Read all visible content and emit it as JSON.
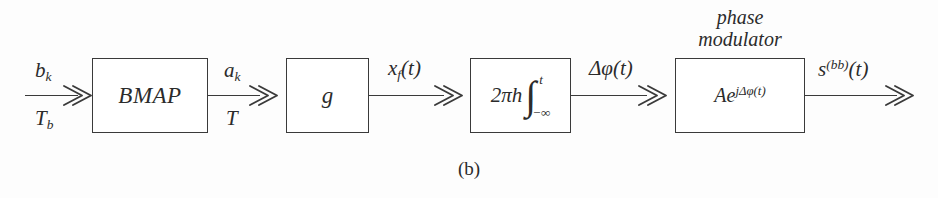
{
  "figure": {
    "caption": "(b)",
    "stroke_color": "#3a3a3a",
    "text_color": "#2b2b2b",
    "background_color": "#fdfdfd"
  },
  "blocks": [
    {
      "id": "bmap",
      "label": "BMAP"
    },
    {
      "id": "g",
      "label": "g"
    },
    {
      "id": "integrator",
      "coefficient": "2πh",
      "integral_sign": "∫",
      "upper_limit": "t",
      "lower_limit": "−∞"
    },
    {
      "id": "modulator",
      "caption_line1": "phase",
      "caption_line2": "modulator",
      "label_base": "Ae",
      "label_exponent": "jΔφ(t)"
    }
  ],
  "signals": {
    "input": {
      "above_base": "b",
      "above_sub": "k",
      "below_base": "T",
      "below_sub": "b"
    },
    "bmap_to_g": {
      "above_base": "a",
      "above_sub": "k",
      "below": "T"
    },
    "g_to_integrator": {
      "above_base": "x",
      "above_sub": "f",
      "above_tail": "(t)"
    },
    "integrator_to_modulator": {
      "above": "Δφ(t)"
    },
    "output": {
      "above_base": "s",
      "above_sup": "(bb)",
      "above_tail": "(t)"
    }
  }
}
